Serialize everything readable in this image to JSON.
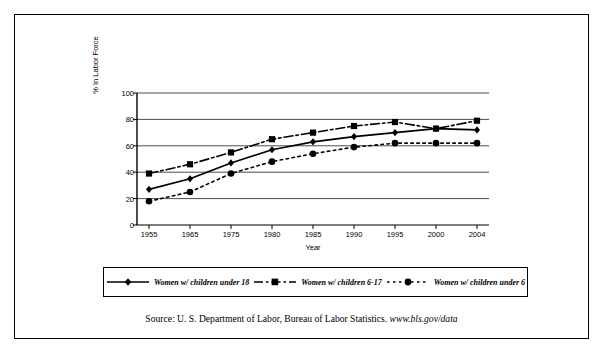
{
  "top_cut_text": "",
  "source": {
    "prefix": "Source:  U. S. Department of Labor, Bureau of Labor Statistics.",
    "url": "www.bls.gov/data"
  },
  "legend": {
    "entries": [
      {
        "label": "Women w/ children under 18",
        "marker": "diamond",
        "line": "solid",
        "color": "#000000"
      },
      {
        "label": "Women w/ children 6-17",
        "marker": "square",
        "line": "dashdot",
        "color": "#000000"
      },
      {
        "label": "Women w/ children under 6",
        "marker": "circle",
        "line": "dotted",
        "color": "#000000"
      }
    ]
  },
  "chart_data": {
    "type": "line",
    "title": "",
    "xlabel": "Year",
    "ylabel": "% In Labor Force",
    "categories": [
      "1955",
      "1965",
      "1975",
      "1980",
      "1985",
      "1990",
      "1995",
      "2000",
      "2004"
    ],
    "ylim": [
      0,
      100
    ],
    "yticks": [
      0,
      20,
      40,
      60,
      80,
      100
    ],
    "grid": true,
    "legend_position": "bottom",
    "series": [
      {
        "name": "Women w/ children under 18",
        "marker": "diamond",
        "line": "solid",
        "values": [
          27,
          35,
          47,
          57,
          63,
          67,
          70,
          73,
          72
        ]
      },
      {
        "name": "Women w/ children 6-17",
        "marker": "square",
        "line": "dashdot",
        "values": [
          39,
          46,
          55,
          65,
          70,
          75,
          78,
          73,
          79
        ]
      },
      {
        "name": "Women w/ children under 6",
        "marker": "circle",
        "line": "dotted",
        "values": [
          18,
          25,
          39,
          48,
          54,
          59,
          62,
          62,
          62
        ]
      }
    ]
  }
}
